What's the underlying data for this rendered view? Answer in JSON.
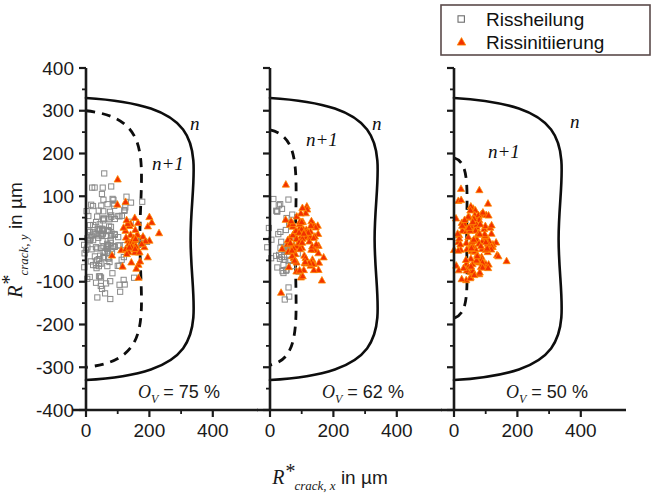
{
  "chart_data": {
    "type": "scatter",
    "title": "",
    "xlabel": "R*crack,x in µm",
    "ylabel": "R*crack,y in µm",
    "xlabel_parts": {
      "main": "R",
      "star": "*",
      "sub": "crack, x",
      "unit": "in µm"
    },
    "ylabel_parts": {
      "main": "R",
      "star": "*",
      "sub": "crack, y",
      "unit": "in µm"
    },
    "xlim": [
      -60,
      470
    ],
    "ylim": [
      -400,
      400
    ],
    "xticks": [
      0,
      200,
      400
    ],
    "xticklabels": [
      "0",
      "200",
      "400"
    ],
    "xminorticks": [
      100,
      300
    ],
    "yticks": [
      -400,
      -300,
      -200,
      -100,
      0,
      100,
      200,
      300,
      400
    ],
    "yticklabels": [
      "-400",
      "-300",
      "-200",
      "-100",
      "0",
      "100",
      "200",
      "300",
      "400"
    ],
    "yminorticks": [
      -350,
      -250,
      -150,
      -50,
      50,
      150,
      250,
      350
    ],
    "grid": false,
    "legend_position": "top-right",
    "series": [
      {
        "name": "Rissheilung",
        "marker": "open-square",
        "color": "#808080",
        "fill": "none"
      },
      {
        "name": "Rissinitiierung",
        "marker": "filled-triangle",
        "color": "#f23100",
        "fill": "#f23100"
      }
    ],
    "panels": [
      {
        "id": "panel-75",
        "annotation": "Ov = 75 %",
        "annot_symbol": "O",
        "annot_sub": "V",
        "annot_value": "= 75 %",
        "curve_n": {
          "label": "n",
          "x_max": 330,
          "y_top": 330,
          "y_bottom": -330,
          "style": "solid"
        },
        "curve_n1": {
          "label": "n+1",
          "x_max": 170,
          "y_top": 300,
          "y_bottom": -300,
          "style": "dashed"
        },
        "healing_points_count": 150,
        "healing_center": [
          60,
          -5
        ],
        "healing_spread": [
          45,
          62
        ],
        "initiation_points_count": 55,
        "initiation_center": [
          150,
          -5
        ],
        "initiation_spread": [
          26,
          38
        ]
      },
      {
        "id": "panel-62",
        "annotation": "Ov = 62 %",
        "annot_symbol": "O",
        "annot_sub": "V",
        "annot_value": "= 62 %",
        "curve_n": {
          "label": "n",
          "x_max": 330,
          "y_top": 330,
          "y_bottom": -330,
          "style": "solid"
        },
        "curve_n1": {
          "label": "n+1",
          "x_max": 80,
          "y_top": 255,
          "y_bottom": -295,
          "style": "dashed"
        },
        "healing_points_count": 50,
        "healing_center": [
          35,
          -20
        ],
        "healing_spread": [
          25,
          60
        ],
        "initiation_points_count": 95,
        "initiation_center": [
          105,
          0
        ],
        "initiation_spread": [
          32,
          48
        ]
      },
      {
        "id": "panel-50",
        "annotation": "Ov = 50 %",
        "annot_symbol": "O",
        "annot_sub": "V",
        "annot_value": "= 50 %",
        "curve_n": {
          "label": "n",
          "x_max": 330,
          "y_top": 330,
          "y_bottom": -330,
          "style": "solid"
        },
        "curve_n1": {
          "label": "n+1",
          "x_max": 40,
          "y_top": 190,
          "y_bottom": -185,
          "style": "dashed"
        },
        "healing_points_count": 0,
        "healing_center": [
          0,
          0
        ],
        "healing_spread": [
          0,
          0
        ],
        "initiation_points_count": 135,
        "initiation_center": [
          70,
          -5
        ],
        "initiation_spread": [
          34,
          42
        ]
      }
    ]
  },
  "legend": {
    "items": [
      {
        "label": "Rissheilung",
        "marker": "open-square"
      },
      {
        "label": "Rissinitiierung",
        "marker": "filled-triangle"
      }
    ]
  },
  "colors": {
    "axis": "#1a1a1a",
    "curve": "#0d0d0d",
    "healing_marker": "#8a8a8a",
    "initiation_marker": "#f23100",
    "initiation_edge": "#ff8c00",
    "legend_border": "#5a4a4a",
    "background": "#ffffff"
  }
}
